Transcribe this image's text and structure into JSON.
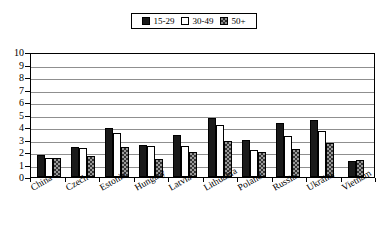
{
  "chart_data": {
    "type": "bar",
    "title": "",
    "xlabel": "",
    "ylabel": "",
    "ylim": [
      0,
      10
    ],
    "ytick_step": 1,
    "grid": true,
    "legend_position": "top-center",
    "categories": [
      "China",
      "Czech",
      "Estonia",
      "Hungary",
      "Latvia",
      "Lithuania",
      "Poland",
      "Russia",
      "Ukraine",
      "Vietnam"
    ],
    "ytick_labels": [
      "10",
      "9",
      "8",
      "7",
      "6",
      "5",
      "4",
      "3",
      "2",
      "1",
      "0"
    ],
    "series": [
      {
        "name": "15-29",
        "fill": "solid-black",
        "values": [
          1.8,
          2.4,
          3.9,
          2.6,
          3.35,
          4.75,
          3.0,
          4.3,
          4.55,
          1.3
        ]
      },
      {
        "name": "30-49",
        "fill": "white",
        "values": [
          1.55,
          2.3,
          3.5,
          2.5,
          2.45,
          4.15,
          2.2,
          3.3,
          3.65,
          0
        ]
      },
      {
        "name": "50+",
        "fill": "pattern-gray",
        "values": [
          1.55,
          1.7,
          2.4,
          1.45,
          2.0,
          2.9,
          2.0,
          2.25,
          2.7,
          1.4
        ]
      }
    ],
    "colors": {
      "series_15_29": "#1a1a1a",
      "series_30_49": "#ffffff",
      "series_50_plus": "#9a9a9a",
      "grid": "#8f8f8f",
      "axis": "#000000",
      "background": "#ffffff"
    }
  },
  "legend": {
    "items": [
      {
        "label": "15-29",
        "swatch": "solid-dark-swatch"
      },
      {
        "label": "30-49",
        "swatch": "white-swatch"
      },
      {
        "label": "50+",
        "swatch": "patterned-swatch"
      }
    ]
  }
}
